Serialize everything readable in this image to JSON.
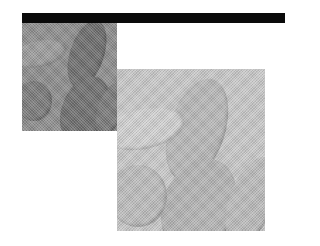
{
  "image": {
    "description": "Two overlapping halftone grayscale panels showing the same abstract image of rounded, finger-like forms; a black bar runs along the top.",
    "bar": {
      "color": "#0a0a0a"
    },
    "panels": [
      {
        "name": "dark-panel",
        "base_color": "#8e8e8e",
        "shapes": [
          {
            "left": 48,
            "top": -4,
            "w": 34,
            "h": 70,
            "rot": 18,
            "color": "#6f6f6f"
          },
          {
            "left": 40,
            "top": 52,
            "w": 46,
            "h": 70,
            "rot": 22,
            "color": "#707070"
          },
          {
            "left": -6,
            "top": 58,
            "w": 36,
            "h": 40,
            "rot": 0,
            "color": "#7c7c7c"
          },
          {
            "left": -10,
            "top": 18,
            "w": 55,
            "h": 26,
            "rot": -12,
            "color": "#9c9c9c"
          },
          {
            "left": 76,
            "top": 58,
            "w": 26,
            "h": 56,
            "rot": 20,
            "color": "#7a7a7a"
          }
        ]
      },
      {
        "name": "light-panel",
        "base_color": "#c9c9c9",
        "shapes": [
          {
            "left": 52,
            "top": 8,
            "w": 56,
            "h": 106,
            "rot": 18,
            "color": "#b8b8b8"
          },
          {
            "left": 46,
            "top": 88,
            "w": 72,
            "h": 98,
            "rot": 22,
            "color": "#b5b5b5"
          },
          {
            "left": -8,
            "top": 96,
            "w": 58,
            "h": 62,
            "rot": 0,
            "color": "#bdbdbd"
          },
          {
            "left": -14,
            "top": 40,
            "w": 82,
            "h": 40,
            "rot": -12,
            "color": "#d2d2d2"
          },
          {
            "left": 112,
            "top": 86,
            "w": 44,
            "h": 92,
            "rot": 20,
            "color": "#bcbcbc"
          }
        ]
      }
    ]
  }
}
